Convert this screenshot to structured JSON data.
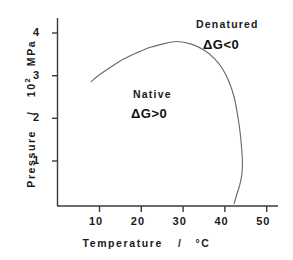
{
  "chart_data": {
    "type": "line",
    "title": "",
    "xlabel": "Temperature / °C",
    "ylabel": "Pressure / 10² MPa",
    "xlim": [
      4,
      53
    ],
    "ylim": [
      0,
      4.55
    ],
    "grid": false,
    "legend": "none",
    "xticks": [
      "10",
      "20",
      "30",
      "40",
      "50"
    ],
    "xtick_values": [
      10,
      20,
      30,
      40,
      50
    ],
    "yticks": [
      "1",
      "2",
      "3",
      "4"
    ],
    "ytick_values": [
      1,
      2,
      3,
      4
    ],
    "series": [
      {
        "name": "phase boundary (elliptical stability curve)",
        "x": [
          8.0,
          10.0,
          13.0,
          16.0,
          19.0,
          22.0,
          25.0,
          28.5,
          32.0,
          35.0,
          37.5,
          39.5,
          41.0,
          42.2,
          43.0,
          43.6,
          44.0,
          44.2,
          44.0,
          43.5,
          42.8,
          42.2
        ],
        "y": [
          2.86,
          3.02,
          3.22,
          3.4,
          3.54,
          3.66,
          3.74,
          3.8,
          3.74,
          3.6,
          3.4,
          3.15,
          2.85,
          2.5,
          2.1,
          1.7,
          1.3,
          0.95,
          0.65,
          0.42,
          0.2,
          0.0
        ]
      }
    ],
    "annotations": [
      {
        "id": "denatured",
        "text": "Denatured",
        "x": 45.0,
        "y": 4.25
      },
      {
        "id": "denatured_eq",
        "text": "ΔG<0",
        "x": 45.5,
        "y": 3.8
      },
      {
        "id": "native",
        "text": "Native",
        "x": 26.0,
        "y": 2.6
      },
      {
        "id": "native_eq",
        "text": "ΔG>0",
        "x": 25.5,
        "y": 2.2
      }
    ]
  },
  "axes": {
    "x_title_main": "Temperature",
    "x_title_sep": "/",
    "x_title_unit": "°C",
    "y_title_main": "Pressure",
    "y_title_sep": "/",
    "y_title_unit_base": "10",
    "y_title_unit_exp": "2",
    "y_title_unit_tail": "MPa",
    "x_tick_labels": [
      "10",
      "20",
      "30",
      "40",
      "50"
    ],
    "y_tick_labels": [
      "4",
      "3",
      "2",
      "1"
    ]
  },
  "regions": {
    "denatured_label": "Denatured",
    "denatured_eq": "ΔG<0",
    "native_label": "Native",
    "native_eq": "ΔG>0"
  },
  "colors": {
    "background": "#ffffff",
    "axis": "#3a3a3a",
    "curve": "#6b6b6b",
    "text": "#1a1a1a"
  }
}
